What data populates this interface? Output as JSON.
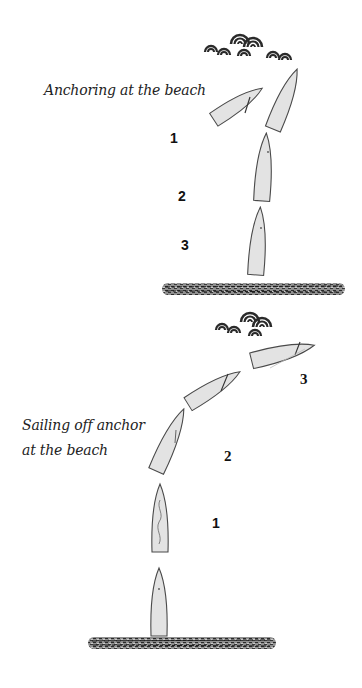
{
  "panels": {
    "anchoring": {
      "caption": "Anchoring at the beach",
      "steps": [
        {
          "label": "1"
        },
        {
          "label": "2"
        },
        {
          "label": "3"
        }
      ]
    },
    "sailing_off": {
      "caption_line1": "Sailing off anchor",
      "caption_line2": "at the beach",
      "steps": [
        {
          "label": "3"
        },
        {
          "label": "2"
        },
        {
          "label": "1"
        }
      ]
    }
  },
  "colors": {
    "boat_fill": "#e3e3e3",
    "boat_outline": "#4a4a4a",
    "wave": "#2a2a2a",
    "beach": "#3a3a3a",
    "text": "#111111"
  },
  "icons": [
    "wind-waves-icon",
    "boat-icon",
    "beach-shoreline-icon"
  ]
}
